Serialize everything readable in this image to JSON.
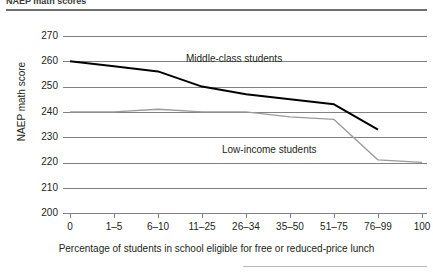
{
  "figure": {
    "title_cutoff": "NAEP math scores",
    "ylabel": "NAEP math score",
    "xlabel": "Percentage of students in school eligible for free or reduced-price lunch"
  },
  "chart_data": {
    "type": "line",
    "title": "",
    "xlabel": "Percentage of students in school eligible for free or reduced-price lunch",
    "ylabel": "NAEP math score",
    "categories": [
      "0",
      "1–5",
      "6–10",
      "11–25",
      "26–34",
      "35–50",
      "51–75",
      "76–99",
      "100"
    ],
    "ylim": [
      200,
      270
    ],
    "yticks": [
      200,
      210,
      220,
      230,
      240,
      250,
      260,
      270
    ],
    "grid": true,
    "legend": "inline-annotations",
    "series": [
      {
        "name": "Middle-class students",
        "color": "#000000",
        "values": [
          260,
          258,
          256,
          250,
          247,
          245,
          243,
          233,
          null
        ]
      },
      {
        "name": "Low-income students",
        "color": "#9b9b9b",
        "values": [
          240,
          240,
          241,
          240,
          240,
          238,
          237,
          221,
          220
        ]
      }
    ]
  }
}
